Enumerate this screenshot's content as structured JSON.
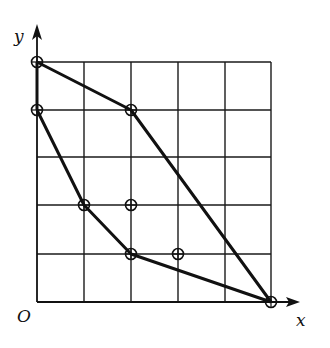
{
  "figure": {
    "axis_x_label": "x",
    "axis_y_label": "y",
    "origin_label": "O",
    "caption": "",
    "grid": {
      "columns": 5,
      "rows": 5,
      "x_lines_px": [
        37,
        84,
        131,
        178,
        225,
        271
      ],
      "y_lines_px": [
        302,
        254,
        205,
        157,
        110,
        62
      ]
    },
    "colors": {
      "stroke": "#111111",
      "background": "#ffffff"
    },
    "outer_path_points": [
      [
        0,
        5
      ],
      [
        2,
        4
      ],
      [
        5,
        0
      ]
    ],
    "inner_path_points": [
      [
        0,
        4
      ],
      [
        1,
        2
      ],
      [
        2,
        1
      ],
      [
        5,
        0
      ]
    ],
    "y_axis_segment": [
      [
        0,
        4
      ],
      [
        0,
        5
      ]
    ],
    "marked_points": [
      [
        0,
        5
      ],
      [
        0,
        4
      ],
      [
        2,
        4
      ],
      [
        1,
        2
      ],
      [
        2,
        2
      ],
      [
        2,
        1
      ],
      [
        3,
        1
      ],
      [
        5,
        0
      ]
    ]
  }
}
